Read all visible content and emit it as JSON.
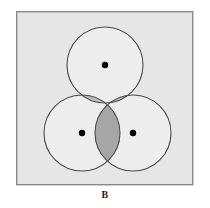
{
  "figure": {
    "caption": "B",
    "panel_label": "B",
    "type": "venn-diagram"
  },
  "panel": {
    "x": 16,
    "y": 11,
    "width": 177,
    "height": 174,
    "fill": "#e6e6e6",
    "border_color": "#8a8a8a",
    "border_width": 1.4
  },
  "colors": {
    "page_background": "#ffffff",
    "panel_background": "#e6e6e6",
    "circle_fill": "#ededed",
    "circle_stroke": "#4a4a4a",
    "overlap_light": "#bdbdbd",
    "overlap_dark": "#a6a6a6",
    "dot_fill": "#000000",
    "caption_color": "#1a1a1a"
  },
  "geometry": {
    "circle_radius": 38,
    "circle_stroke_width": 1.1,
    "dot_radius": 3.2
  },
  "circles": [
    {
      "id": "top",
      "name": "circle-top",
      "cx": 105,
      "cy": 65,
      "r": 38
    },
    {
      "id": "left",
      "name": "circle-left",
      "cx": 82,
      "cy": 133,
      "r": 38
    },
    {
      "id": "right",
      "name": "circle-right",
      "cx": 133,
      "cy": 133,
      "r": 38
    }
  ],
  "dots": [
    {
      "id": "dot-top",
      "cx": 105,
      "cy": 65,
      "r": 3.2
    },
    {
      "id": "dot-left",
      "cx": 82,
      "cy": 133,
      "r": 3.2
    },
    {
      "id": "dot-right",
      "cx": 133,
      "cy": 133,
      "r": 3.2
    }
  ],
  "overlaps": [
    {
      "id": "top-left",
      "name": "overlap-top-left",
      "shade": "light"
    },
    {
      "id": "top-right",
      "name": "overlap-top-right",
      "shade": "light"
    },
    {
      "id": "left-right",
      "name": "overlap-left-right",
      "shade": "dark"
    }
  ]
}
